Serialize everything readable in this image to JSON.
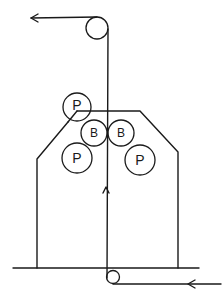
{
  "diagram": {
    "type": "belt-roller-schematic",
    "line_color": "#1a1a1a",
    "background": "#ffffff",
    "labels": {
      "press_roller": "P",
      "belt_roller": "B"
    },
    "rollers": [
      {
        "id": "top-pulley",
        "label": "",
        "cx": 97,
        "cy": 28,
        "r": 11
      },
      {
        "id": "press-roller-top-left",
        "label": "P",
        "cx": 77,
        "cy": 107,
        "r": 14
      },
      {
        "id": "belt-roller-left",
        "label": "B",
        "cx": 94,
        "cy": 133,
        "r": 13
      },
      {
        "id": "belt-roller-right",
        "label": "B",
        "cx": 121,
        "cy": 133,
        "r": 13
      },
      {
        "id": "press-roller-bottom-left",
        "label": "P",
        "cx": 77,
        "cy": 158,
        "r": 15
      },
      {
        "id": "press-roller-bottom-right",
        "label": "P",
        "cx": 140,
        "cy": 160,
        "r": 15
      },
      {
        "id": "bottom-pulley",
        "label": "",
        "cx": 113,
        "cy": 277,
        "r": 6.5
      }
    ],
    "arrows": [
      {
        "id": "output-arrow",
        "direction": "left"
      },
      {
        "id": "upward-flow-arrow",
        "direction": "up"
      },
      {
        "id": "input-arrow",
        "direction": "left"
      }
    ]
  }
}
